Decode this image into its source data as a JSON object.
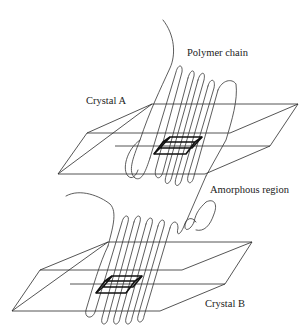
{
  "diagram": {
    "type": "polymer crystal schematic",
    "labels": {
      "polymer_chain": "Polymer chain",
      "crystal_a": "Crystal A",
      "amorphous_region": "Amorphous region",
      "crystal_b": "Crystal B"
    },
    "colors": {
      "line": "#2a2a2a",
      "unit_cell": "#111111",
      "background": "#ffffff"
    },
    "elements": [
      {
        "name": "crystal-a",
        "kind": "crystal slab with folded chains and unit cell"
      },
      {
        "name": "crystal-b",
        "kind": "crystal slab with folded chains and unit cell"
      },
      {
        "name": "tie-chain",
        "kind": "chain connecting crystal A and crystal B through amorphous region"
      }
    ]
  }
}
